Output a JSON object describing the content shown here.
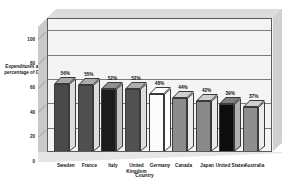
{
  "chart_data": {
    "type": "bar",
    "title": "",
    "xlabel": "Country",
    "ylabel": "Expenditures as a percentage of GDP",
    "categories": [
      "Sweden",
      "France",
      "Italy",
      "United Kingdom",
      "Germany",
      "Canada",
      "Japan",
      "United States",
      "Australia"
    ],
    "values": [
      56,
      55,
      52,
      52,
      48,
      44,
      42,
      39,
      37
    ],
    "data_labels": [
      "56%",
      "55%",
      "52%",
      "52%",
      "48%",
      "44%",
      "42%",
      "39%",
      "37%"
    ],
    "ylim": [
      0,
      110
    ],
    "yticks": [
      "0",
      "20",
      "40",
      "60",
      "80",
      "100"
    ],
    "ytick_values": [
      0,
      20,
      40,
      60,
      80,
      100
    ],
    "grid": true,
    "legend": "none",
    "three_d": true,
    "bar_colors": [
      "#4a4a4a",
      "#4f4f4f",
      "#1c1c1c",
      "#515151",
      "#fbfbfb",
      "#8c8c8c",
      "#8a8a8a",
      "#0d0d0d",
      "#8e8e8e"
    ],
    "bar_top_colors": [
      "#a8a8a8",
      "#ababab",
      "#8f8f8f",
      "#adadad",
      "#ffffff",
      "#cfcfcf",
      "#cdcdcd",
      "#808080",
      "#d0d0d0"
    ],
    "bar_side_colors": [
      "#dcdcdc",
      "#dcdcdc",
      "#c2c2c2",
      "#dedede",
      "#ffffff",
      "#ececec",
      "#eaeaea",
      "#b0b0b0",
      "#ededed"
    ]
  },
  "axis": {
    "y_title": "Expenditures as a percentage of GDP",
    "x_title": "Country"
  }
}
